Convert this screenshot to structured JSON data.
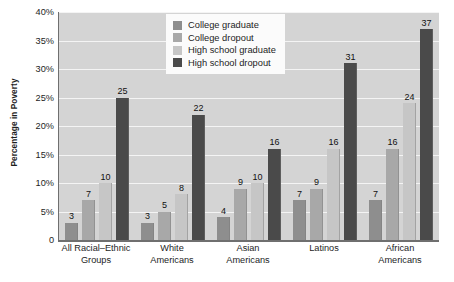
{
  "chart_data": {
    "type": "bar",
    "title": "",
    "subtitle": "",
    "xlabel": "",
    "ylabel": "Percentage in Poverty",
    "ylim": [
      0,
      40
    ],
    "grid": true,
    "legend_position": "top-center",
    "y_ticks": [
      {
        "value": 40,
        "label": "40%"
      },
      {
        "value": 35,
        "label": "35%"
      },
      {
        "value": 30,
        "label": "30%"
      },
      {
        "value": 25,
        "label": "25%"
      },
      {
        "value": 20,
        "label": "20%"
      },
      {
        "value": 15,
        "label": "15%"
      },
      {
        "value": 10,
        "label": "10%"
      },
      {
        "value": 5,
        "label": "5%"
      },
      {
        "value": 0,
        "label": "0"
      }
    ],
    "categories": [
      "All Racial–Ethnic Groups",
      "White Americans",
      "Asian Americans",
      "Latinos",
      "African Americans"
    ],
    "category_lines": [
      [
        "All Racial–Ethnic",
        "Groups"
      ],
      [
        "White",
        "Americans"
      ],
      [
        "Asian",
        "Americans"
      ],
      [
        "Latinos",
        ""
      ],
      [
        "African",
        "Americans"
      ]
    ],
    "series": [
      {
        "name": "College graduate",
        "color": "#8e8e8e",
        "values": [
          3,
          3,
          4,
          7,
          7
        ]
      },
      {
        "name": "College dropout",
        "color": "#a8a8a8",
        "values": [
          7,
          5,
          9,
          9,
          16
        ]
      },
      {
        "name": "High school graduate",
        "color": "#c6c6c6",
        "values": [
          10,
          8,
          10,
          16,
          24
        ]
      },
      {
        "name": "High school dropout",
        "color": "#4a4a4a",
        "values": [
          25,
          22,
          16,
          31,
          37
        ]
      }
    ],
    "colors": {
      "plot_background": "#d4d4d4",
      "gridline": "#f4f4f4",
      "axis": "#6f6f6f",
      "text": "#1d1d1d",
      "legend_background": "#fbfbfb"
    }
  }
}
